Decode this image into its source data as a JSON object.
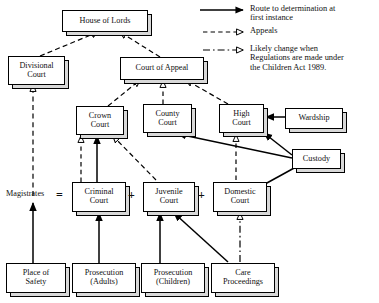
{
  "diagram": {
    "colors": {
      "ink": "#111111",
      "line": "#000000",
      "shadow": "#d8d8d8",
      "paper": "#ffffff"
    },
    "nodes": [
      {
        "id": "house-of-lords",
        "label": "House of Lords",
        "x": 62,
        "y": 10,
        "w": 84,
        "h": 20,
        "size": 8.2
      },
      {
        "id": "divisional-court",
        "label": "Divisional\nCourt",
        "x": 8,
        "y": 56,
        "w": 55,
        "h": 27,
        "size": 8.2
      },
      {
        "id": "court-of-appeal",
        "label": "Court of Appeal",
        "x": 120,
        "y": 57,
        "w": 82,
        "h": 21,
        "size": 8.2
      },
      {
        "id": "crown-court",
        "label": "Crown\nCourt",
        "x": 76,
        "y": 106,
        "w": 46,
        "h": 27,
        "size": 8.2
      },
      {
        "id": "county-court",
        "label": "County\nCourt",
        "x": 143,
        "y": 104,
        "w": 47,
        "h": 27,
        "size": 8.2
      },
      {
        "id": "high-court",
        "label": "High\nCourt",
        "x": 219,
        "y": 104,
        "w": 43,
        "h": 27,
        "size": 8.2
      },
      {
        "id": "wardship",
        "label": "Wardship",
        "x": 285,
        "y": 108,
        "w": 56,
        "h": 19,
        "size": 8.2
      },
      {
        "id": "custody",
        "label": "Custody",
        "x": 292,
        "y": 149,
        "w": 47,
        "h": 18,
        "size": 8.2
      },
      {
        "id": "criminal-court",
        "label": "Criminal\nCourt",
        "x": 72,
        "y": 182,
        "w": 52,
        "h": 28,
        "size": 8.2
      },
      {
        "id": "juvenile-court",
        "label": "Juvenile\nCourt",
        "x": 143,
        "y": 182,
        "w": 50,
        "h": 28,
        "size": 8.2
      },
      {
        "id": "domestic-court",
        "label": "Domestic\nCourt",
        "x": 213,
        "y": 182,
        "w": 52,
        "h": 28,
        "size": 8.2
      },
      {
        "id": "place-of-safety",
        "label": "Place of\nSafety",
        "x": 6,
        "y": 263,
        "w": 58,
        "h": 28,
        "size": 8.2
      },
      {
        "id": "prosecution-adults",
        "label": "Prosecution\n(Adults)",
        "x": 72,
        "y": 263,
        "w": 62,
        "h": 28,
        "size": 8.2
      },
      {
        "id": "prosecution-children",
        "label": "Prosecution\n(Children)",
        "x": 141,
        "y": 263,
        "w": 62,
        "h": 28,
        "size": 8.2
      },
      {
        "id": "care-proceedings",
        "label": "Care\nProceedings",
        "x": 211,
        "y": 263,
        "w": 62,
        "h": 28,
        "size": 8.2
      }
    ],
    "labels": [
      {
        "id": "magistrates-label",
        "text": "Magistrates",
        "x": 6,
        "y": 189,
        "size": 8.2
      },
      {
        "id": "operator-equals",
        "text": "=",
        "x": 56,
        "y": 188,
        "size": 12
      },
      {
        "id": "operator-plus-1",
        "text": "+",
        "x": 128,
        "y": 188,
        "size": 12
      },
      {
        "id": "operator-plus-2",
        "text": "+",
        "x": 198,
        "y": 188,
        "size": 12
      }
    ],
    "legend": {
      "items": [
        {
          "id": "legend-route",
          "style": "solid-filled",
          "text": "Route to determination at\nfirst instance"
        },
        {
          "id": "legend-appeals",
          "style": "dashed-hollow",
          "text": "Appeals"
        },
        {
          "id": "legend-change",
          "style": "dashdot-hollow",
          "text": "Likely change when\nRegulations are made under\nthe Children Act 1989."
        }
      ]
    },
    "edges": [
      {
        "id": "edge-divisional-to-lords",
        "from": "divisional-court",
        "to": "house-of-lords",
        "style": "dashed-hollow"
      },
      {
        "id": "edge-appeal-to-lords",
        "from": "court-of-appeal",
        "to": "house-of-lords",
        "style": "dashed-hollow"
      },
      {
        "id": "edge-crown-to-appeal",
        "from": "crown-court",
        "to": "court-of-appeal",
        "style": "dashed-hollow"
      },
      {
        "id": "edge-county-to-appeal",
        "from": "county-court",
        "to": "court-of-appeal",
        "style": "dashed-hollow"
      },
      {
        "id": "edge-high-to-appeal",
        "from": "high-court",
        "to": "court-of-appeal",
        "style": "dashed-hollow"
      },
      {
        "id": "edge-magistrates-to-divisional",
        "from": "magistrates",
        "to": "divisional-court",
        "style": "dashed-hollow"
      },
      {
        "id": "edge-criminal-to-crown-appeal",
        "from": "criminal-court",
        "to": "crown-court",
        "style": "dashed-hollow"
      },
      {
        "id": "edge-criminal-to-crown-route",
        "from": "criminal-court",
        "to": "crown-court",
        "style": "solid-filled"
      },
      {
        "id": "edge-juvenile-to-crown",
        "from": "juvenile-court",
        "to": "crown-court",
        "style": "dashed-hollow"
      },
      {
        "id": "edge-domestic-to-high",
        "from": "domestic-court",
        "to": "high-court",
        "style": "dashed-hollow"
      },
      {
        "id": "edge-wardship-to-high",
        "from": "wardship",
        "to": "high-court",
        "style": "solid-filled"
      },
      {
        "id": "edge-custody-to-high",
        "from": "custody",
        "to": "high-court",
        "style": "solid-filled"
      },
      {
        "id": "edge-custody-to-county",
        "from": "custody",
        "to": "county-court",
        "style": "solid-filled"
      },
      {
        "id": "edge-custody-to-domestic",
        "from": "custody",
        "to": "domestic-court",
        "style": "solid-filled"
      },
      {
        "id": "edge-place-to-criminal",
        "from": "place-of-safety",
        "to": "magistrates",
        "style": "solid-filled"
      },
      {
        "id": "edge-prosecution-adults",
        "from": "prosecution-adults",
        "to": "criminal-court",
        "style": "solid-filled"
      },
      {
        "id": "edge-prosecution-children",
        "from": "prosecution-children",
        "to": "juvenile-court",
        "style": "solid-filled"
      },
      {
        "id": "edge-care-to-juvenile",
        "from": "care-proceedings",
        "to": "juvenile-court",
        "style": "solid-filled"
      },
      {
        "id": "edge-care-to-domestic",
        "from": "care-proceedings",
        "to": "domestic-court",
        "style": "dashdot-hollow"
      }
    ]
  }
}
